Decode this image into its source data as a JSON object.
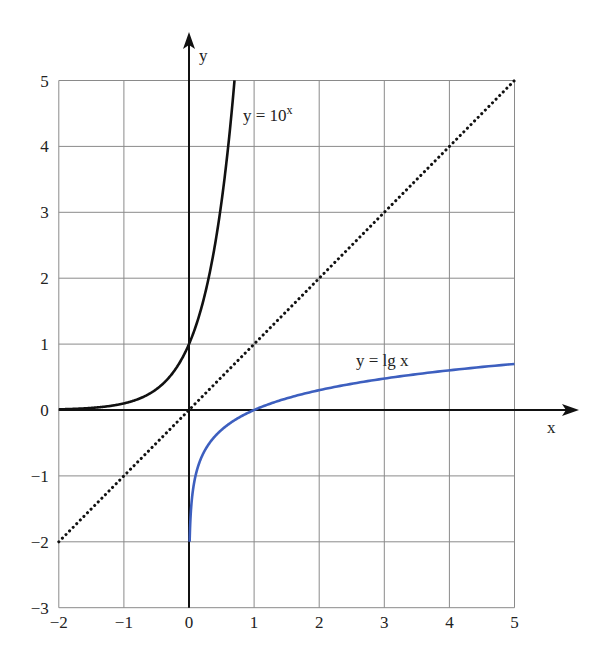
{
  "chart_data": {
    "type": "line",
    "title": "",
    "xlabel": "x",
    "ylabel": "y",
    "xlim": [
      -2,
      5
    ],
    "ylim": [
      -3,
      5
    ],
    "grid": true,
    "x_ticks": [
      "−2",
      "−1",
      "0",
      "1",
      "2",
      "3",
      "4",
      "5"
    ],
    "y_ticks": [
      "5",
      "4",
      "3",
      "2",
      "1",
      "0",
      "−1",
      "−2",
      "−3"
    ],
    "series": [
      {
        "name": "y = 10^x",
        "label_text": "y = 10",
        "label_sup": "x",
        "color": "#111111",
        "style": "solid",
        "x": [
          -2,
          -1.5,
          -1,
          -0.75,
          -0.5,
          -0.3,
          -0.2,
          -0.1,
          0,
          0.1,
          0.2,
          0.3,
          0.4,
          0.5,
          0.6,
          0.699
        ],
        "y": [
          0.01,
          0.032,
          0.1,
          0.178,
          0.316,
          0.501,
          0.631,
          0.794,
          1,
          1.259,
          1.585,
          1.995,
          2.512,
          3.162,
          3.981,
          5.0
        ]
      },
      {
        "name": "y = x",
        "label_text": "",
        "color": "#111111",
        "style": "dotted",
        "x": [
          -2,
          5
        ],
        "y": [
          -2,
          5
        ]
      },
      {
        "name": "y = lg x",
        "label_text": "y = lg x",
        "color": "#3d5fbf",
        "style": "solid",
        "x": [
          0.01,
          0.02,
          0.05,
          0.1,
          0.2,
          0.3,
          0.5,
          0.75,
          1,
          1.5,
          2,
          2.5,
          3,
          3.5,
          4,
          4.5,
          5
        ],
        "y": [
          -2,
          -1.699,
          -1.301,
          -1,
          -0.699,
          -0.523,
          -0.301,
          -0.125,
          0,
          0.176,
          0.301,
          0.398,
          0.477,
          0.544,
          0.602,
          0.653,
          0.699
        ]
      }
    ],
    "legend": "inline labels on curves"
  }
}
